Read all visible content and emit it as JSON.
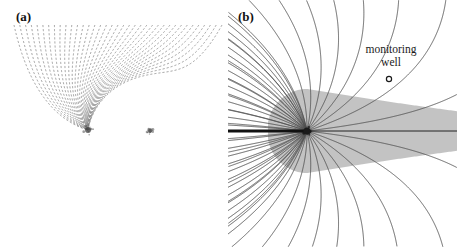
{
  "figure": {
    "type": "scientific-figure",
    "background_color": "#ffffff",
    "width": 457,
    "height": 247,
    "panel_count": 2
  },
  "panels": [
    {
      "id": "a",
      "label": "(a)",
      "description": "Dashed streamline flow field deflected around two singular points (doublet / injection-extraction well pair)",
      "line_style": "dashed",
      "line_color": "#8f8f8f",
      "flow_direction": "vertical",
      "streamline_count": 37,
      "singular_points": [
        {
          "name": "primary-well",
          "x": 88,
          "y": 130,
          "size": 7,
          "color": "#4a4a4a"
        },
        {
          "name": "secondary-well",
          "x": 150,
          "y": 131,
          "size": 4.5,
          "color": "#5a5a5a"
        }
      ],
      "frame": "none"
    },
    {
      "id": "b",
      "label": "(b)",
      "description": "Solid streamline flow field with shaded capture zone, pumping well and monitoring well",
      "line_style": "solid",
      "line_color": "#4d4d4d",
      "flow_direction": "horizontal",
      "streamline_count": 29,
      "capture_zone": {
        "name": "capture-zone",
        "fill_color": "#b9b9b9",
        "opacity": 0.85
      },
      "pumping_well": {
        "name": "pumping-well",
        "x": 79,
        "y": 131,
        "size": 8,
        "color": "#1a1a1a"
      },
      "stagnation_point": {
        "name": "stagnation-point",
        "x": 175,
        "y": 131
      },
      "divide_line": {
        "name": "flow-divide-line",
        "thick_segment": {
          "x1": 0,
          "y1": 131,
          "x2": 79,
          "y2": 131,
          "width": 3.2
        },
        "thin_segment": {
          "x1": 79,
          "y1": 131,
          "x2": 229,
          "y2": 131,
          "width": 0.9
        },
        "color": "#111111"
      },
      "monitoring_well": {
        "name": "monitoring-well",
        "label_line_1": "monitoring",
        "label_line_2": "well",
        "marker_x": 161,
        "marker_y": 79,
        "marker_radius": 2.6,
        "marker_color": "#1a1a1a",
        "label_x": 163,
        "label_y_1": 53,
        "label_y_2": 66
      },
      "frame": "none"
    }
  ],
  "chart_data": {
    "type": "line",
    "title": "",
    "xlabel": "",
    "ylabel": "",
    "grid": false,
    "legend_position": "none",
    "subplots": [
      {
        "panel": "(a)",
        "series_name": "streamlines-dipole",
        "style": "dashed",
        "n_streamlines": 37,
        "annotations": [
          "(a)"
        ]
      },
      {
        "panel": "(b)",
        "series_name": "streamlines-capture-zone",
        "style": "solid",
        "n_streamlines": 29,
        "annotations": [
          "(b)",
          "monitoring well"
        ]
      }
    ]
  }
}
